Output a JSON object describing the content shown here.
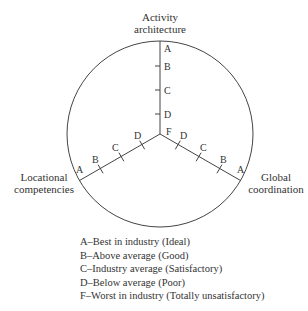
{
  "diagram": {
    "axes": [
      {
        "id": "activity",
        "label_lines": [
          "Activity",
          "architecture"
        ]
      },
      {
        "id": "locational",
        "label_lines": [
          "Locational",
          "competencies"
        ]
      },
      {
        "id": "global",
        "label_lines": [
          "Global",
          "coordination"
        ]
      }
    ],
    "center_label": "F",
    "tick_labels": [
      "A",
      "B",
      "C",
      "D"
    ],
    "line_color": "#444444"
  },
  "legend": {
    "items": [
      "A–Best in industry (Ideal)",
      "B–Above average (Good)",
      "C–Industry average (Satisfactory)",
      "D–Below average (Poor)",
      "F–Worst in industry (Totally unsatisfactory)"
    ]
  }
}
